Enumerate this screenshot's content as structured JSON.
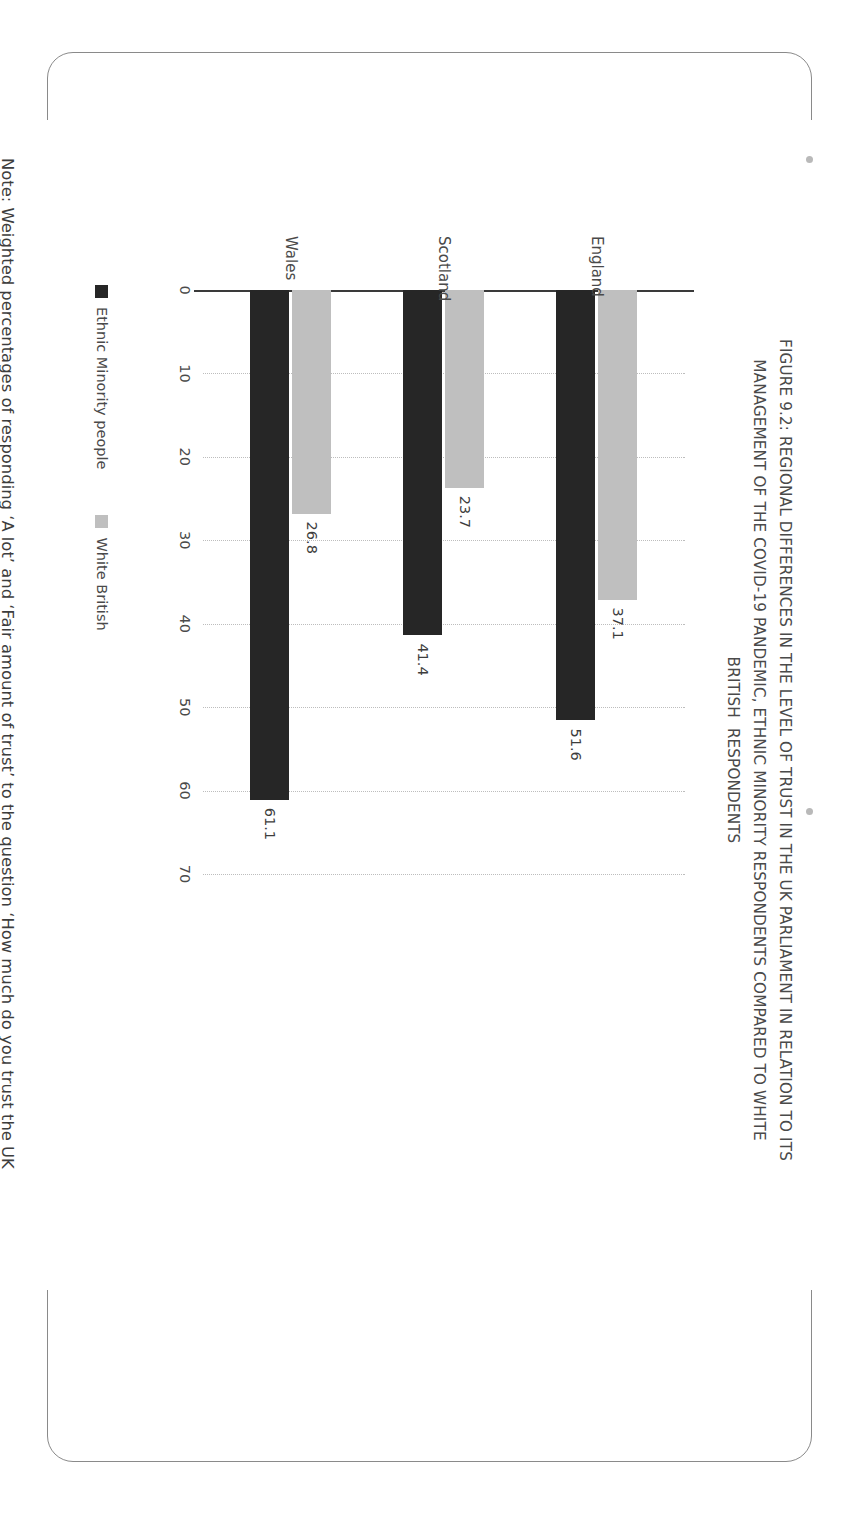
{
  "figure": {
    "title_lines": [
      "FIGURE 9.2: REGIONAL DIFFERENCES IN THE LEVEL OF TRUST IN THE UK PARLIAMENT IN RELATION TO ITS",
      "MANAGEMENT OF THE COVID-19 PANDEMIC, ETHNIC MINORITY RESPONDENTS COMPARED TO WHITE",
      "BRITISH  RESPONDENTS"
    ],
    "note_lines": [
      "Note: Weighted percentages of responding ‘A lot’ and ‘Fair amount of trust’ to the question ‘How much do you trust the UK",
      "Parliament in relation to its management of the coronavirus outbreak?’ England: N=10,830; Scotland: N=1,038; Wales: N=782"
    ]
  },
  "colors": {
    "minority": "#262626",
    "white_british": "#bfbfbf",
    "axis": "#3a3a3a",
    "grid": "#bdbdbd",
    "title_text": "#4a4a4a",
    "frame": "#8a8a8a"
  },
  "chart_data": {
    "type": "bar",
    "orientation": "horizontal",
    "xlabel": "",
    "ylabel": "",
    "categories": [
      "England",
      "Scotland",
      "Wales"
    ],
    "series": [
      {
        "name": "Ethnic Minority people",
        "color": "#262626",
        "values": [
          51.6,
          41.4,
          61.1
        ]
      },
      {
        "name": "White British",
        "color": "#bfbfbf",
        "values": [
          37.1,
          23.7,
          26.8
        ]
      }
    ],
    "value_axis_ticks": [
      0,
      10,
      20,
      30,
      40,
      50,
      60,
      70
    ],
    "xlim": [
      0,
      70
    ],
    "grid": true,
    "grid_style": "dotted",
    "legend_position": "bottom",
    "sample_sizes": {
      "England": "N=10,830",
      "Scotland": "N=1,038",
      "Wales": "N=782"
    }
  }
}
